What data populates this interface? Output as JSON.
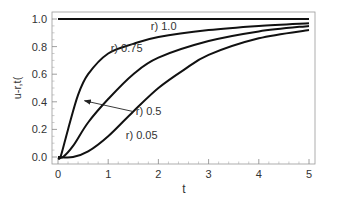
{
  "chart_data": {
    "type": "line",
    "title": "",
    "xlabel": "t",
    "ylabel": "u-r,t(",
    "xlim": [
      0,
      5
    ],
    "ylim": [
      0,
      1.05
    ],
    "grid": false,
    "legend": "inline annotations",
    "x_ticks": [
      "0",
      "1",
      "2",
      "3",
      "4",
      "5"
    ],
    "y_ticks": [
      "0.0",
      "0.2",
      "0.4",
      "0.6",
      "0.8",
      "1.0"
    ],
    "series": [
      {
        "name": "r) 1.0",
        "x": [
          0,
          0.5,
          1,
          2,
          3,
          4,
          5
        ],
        "values": [
          1.0,
          1.0,
          1.0,
          1.0,
          1.0,
          1.0,
          1.0
        ]
      },
      {
        "name": "r) 0.75",
        "x": [
          0,
          0.05,
          0.2,
          0.4,
          0.6,
          1,
          1.5,
          2,
          3,
          4,
          5
        ],
        "values": [
          0,
          0,
          0.2,
          0.45,
          0.6,
          0.75,
          0.82,
          0.87,
          0.92,
          0.95,
          0.97
        ]
      },
      {
        "name": "r) 0.5",
        "x": [
          0,
          0.1,
          0.3,
          0.6,
          1,
          1.5,
          2,
          3,
          4,
          5
        ],
        "values": [
          0,
          0,
          0.08,
          0.25,
          0.42,
          0.6,
          0.72,
          0.84,
          0.91,
          0.95
        ]
      },
      {
        "name": "r) 0.05",
        "x": [
          0,
          0.3,
          0.6,
          1,
          1.5,
          2,
          2.5,
          3,
          4,
          5
        ],
        "values": [
          0,
          0,
          0.04,
          0.15,
          0.33,
          0.5,
          0.63,
          0.74,
          0.86,
          0.92
        ]
      }
    ],
    "annotations": [
      {
        "text": "r) 1.0",
        "x": 1.85,
        "y": 0.95
      },
      {
        "text": "r) 0.75",
        "x": 1.05,
        "y": 0.79
      },
      {
        "text": "r) 0.5",
        "x": 1.55,
        "y": 0.33,
        "arrow_to": [
          0.45,
          0.4
        ]
      },
      {
        "text": "r) 0.05",
        "x": 1.35,
        "y": 0.16
      }
    ]
  }
}
